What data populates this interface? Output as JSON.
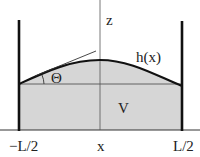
{
  "diagram": {
    "labels": {
      "z_axis": "z",
      "height_function": "h(x)",
      "contact_angle": "Θ",
      "volume": "V",
      "x_axis": "x",
      "left_bound": "−L/2",
      "right_bound": "L/2"
    },
    "colors": {
      "fill": "#d6d6d6",
      "stroke": "#111111",
      "axis": "#555555",
      "background": "#ffffff"
    }
  }
}
